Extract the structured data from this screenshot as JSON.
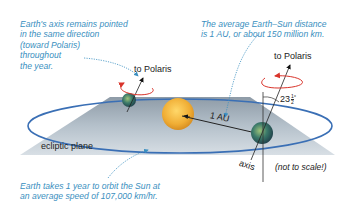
{
  "annotations": {
    "axis_note": [
      "Earth's axis remains pointed",
      "in the same direction",
      "(toward Polaris)",
      "throughout",
      "the year."
    ],
    "distance_note": [
      "The average Earth–Sun distance",
      "is 1 AU, or about 150 million km."
    ],
    "orbit_note": [
      "Earth takes 1 year to orbit the Sun at",
      "an average speed of 107,000 km/hr."
    ]
  },
  "labels": {
    "polaris_left": "to Polaris",
    "polaris_right": "to Polaris",
    "tilt": "23",
    "tilt_fraction_num": "1",
    "tilt_fraction_den": "2",
    "tilt_degree": "°",
    "distance": "1 AU",
    "ecliptic": "ecliptic plane",
    "axis": "axis",
    "scale_note": "(not to scale!)"
  },
  "colors": {
    "annotation_text": "#3a8fc0",
    "plane": "#aebbc6",
    "orbit": "#3a6fb5",
    "sun": "#f2b23a",
    "rotation_arrow": "#d9342b"
  }
}
